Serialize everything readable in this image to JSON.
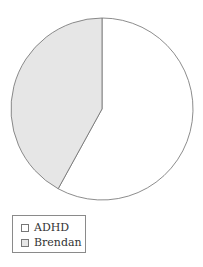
{
  "chart_data": {
    "type": "pie",
    "title": "",
    "slices": [
      {
        "label": "ADHD",
        "value": 58,
        "color": "#ffffff"
      },
      {
        "label": "Brendan",
        "value": 42,
        "color": "#e6e6e6"
      }
    ],
    "start_angle_deg": 0,
    "direction": "ADHD clockwise from top, Brendan counterclockwise from top",
    "legend_position": "bottom-left"
  },
  "legend": {
    "items": [
      {
        "label": "ADHD",
        "color": "#ffffff"
      },
      {
        "label": "Brendan",
        "color": "#e6e6e6"
      }
    ]
  }
}
